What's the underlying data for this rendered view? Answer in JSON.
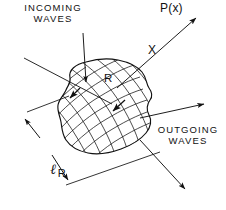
{
  "figure": {
    "background_color": "#ffffff",
    "ink_color": "#111111",
    "width": 226,
    "height": 210
  },
  "labels": {
    "incoming_waves": "INCOMING\nWAVES",
    "outgoing_waves": "OUTGOING\nWAVES",
    "observation_point": "P(x)",
    "direction_axis": "X",
    "region_label": "R",
    "scale_symbol": "ℓ",
    "scale_subscript": "R"
  },
  "elements": {
    "scattering_region": "irregular-closed-blob-with-curvilinear-cross-hatch-grid",
    "incoming_leader": "leader-line-from-incoming-waves-text-to-region",
    "incoming_ray": "ray-entering-region-from-upper-left",
    "outgoing_ray_right": "arrow-leaving-region-toward-right",
    "outgoing_ray_lower_right": "arrow-leaving-region-toward-lower-right",
    "px_ray": "arrow-from-region-to-observation-point-P-of-x",
    "dimension_line": "double-headed-dimension-arrow-for-l-R",
    "interior_arrow_upper": "short-arrow-inside-region-upper-left",
    "interior_arrow_center": "short-arrow-inside-region-center"
  }
}
